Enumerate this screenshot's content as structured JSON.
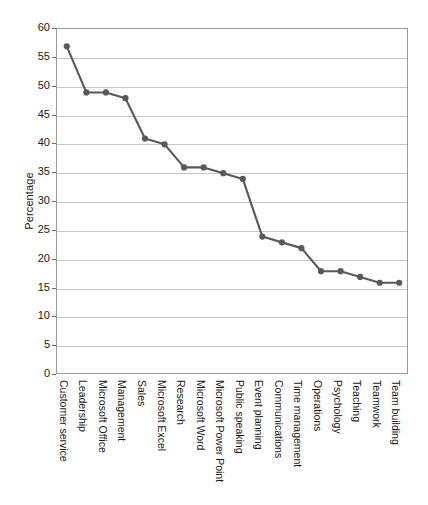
{
  "chart_data": {
    "type": "line",
    "title": "",
    "xlabel": "",
    "ylabel": "Percentage",
    "ylim": [
      0,
      60
    ],
    "ytick_step": 5,
    "yticks": [
      0,
      5,
      10,
      15,
      20,
      25,
      30,
      35,
      40,
      45,
      50,
      55,
      60
    ],
    "grid": true,
    "grid_axis": "y",
    "legend": false,
    "legend_position": "none",
    "marker": "circle",
    "line_color": "#595959",
    "marker_color": "#595959",
    "grid_color": "#c8c8c8",
    "frame_color": "#9a9a9a",
    "categories": [
      "Customer service",
      "Leadership",
      "Microsoft Office",
      "Management",
      "Sales",
      "Microsoft Excel",
      "Research",
      "Microsoft Word",
      "Microsoft Power Point",
      "Public speaking",
      "Event planning",
      "Communications",
      "Time management",
      "Operations",
      "Psychology",
      "Teaching",
      "Teamwork",
      "Team building"
    ],
    "values": [
      57,
      49,
      49,
      48,
      41,
      40,
      36,
      36,
      35,
      34,
      24,
      23,
      22,
      18,
      18,
      17,
      16,
      16
    ]
  }
}
